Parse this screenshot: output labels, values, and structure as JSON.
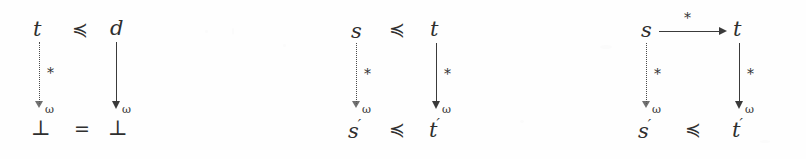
{
  "figure": {
    "background_color": "#fefefe",
    "ink_color": "#2e2e2e",
    "symbols": {
      "preceq": "≼",
      "equals": "=",
      "star": "*",
      "omega": "ω",
      "bottom": "⊥",
      "prime": "′"
    }
  },
  "diagrams": [
    {
      "id": "diagram-1",
      "top_left_term": "t",
      "top_relation": "≼",
      "top_right_term": "d",
      "left_arrow": {
        "style": "dotted",
        "label": "*",
        "subscript": "ω"
      },
      "right_arrow": {
        "style": "solid",
        "label": "",
        "subscript": "ω"
      },
      "bottom_left_term": "⊥",
      "bottom_relation": "=",
      "bottom_right_term": "⊥",
      "horizontal_top_arrow": null
    },
    {
      "id": "diagram-2",
      "top_left_term": "s",
      "top_relation": "≼",
      "top_right_term": "t",
      "left_arrow": {
        "style": "dotted",
        "label": "*",
        "subscript": "ω"
      },
      "right_arrow": {
        "style": "solid",
        "label": "*",
        "subscript": "ω"
      },
      "bottom_left_term": "s",
      "bottom_left_prime": "′",
      "bottom_relation": "≼",
      "bottom_right_term": "t",
      "bottom_right_prime": "′",
      "horizontal_top_arrow": null
    },
    {
      "id": "diagram-3",
      "top_left_term": "s",
      "top_relation": "",
      "top_right_term": "t",
      "left_arrow": {
        "style": "dotted",
        "label": "*",
        "subscript": "ω"
      },
      "right_arrow": {
        "style": "solid",
        "label": "*",
        "subscript": "ω"
      },
      "bottom_left_term": "s",
      "bottom_left_prime": "′",
      "bottom_relation": "≼",
      "bottom_right_term": "t",
      "bottom_right_prime": "′",
      "horizontal_top_arrow": {
        "style": "solid",
        "label": "*",
        "direction": "right"
      }
    }
  ]
}
